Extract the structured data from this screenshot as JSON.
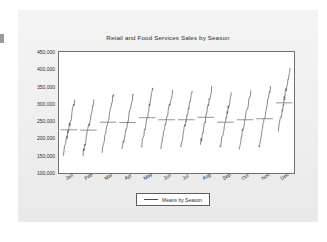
{
  "chart_data": {
    "type": "line",
    "title": "Retail and Food Services Sales by Season",
    "xlabel": "",
    "ylabel": "",
    "ylim": [
      100000,
      450000
    ],
    "ytick_labels": [
      "450,000",
      "400,000",
      "350,000",
      "300,000",
      "250,000",
      "200,000",
      "150,000",
      "100,000"
    ],
    "ytick_values": [
      450000,
      400000,
      350000,
      300000,
      250000,
      200000,
      150000,
      100000
    ],
    "grid": false,
    "legend_position": "below-center",
    "legend_entries": [
      "Means by Season"
    ],
    "categories": [
      "Jan",
      "Feb",
      "Mar",
      "Apr",
      "May",
      "Jun",
      "Jul",
      "Aug",
      "Sep",
      "Oct",
      "Nov",
      "Dec"
    ],
    "series": [
      {
        "name": "Means by Season",
        "values": [
          225000,
          224000,
          247000,
          246000,
          260000,
          254000,
          254000,
          261000,
          247000,
          254000,
          257000,
          303000
        ]
      }
    ],
    "season_ranges": [
      {
        "month": "Jan",
        "min": 148000,
        "max": 310000,
        "mean": 225000
      },
      {
        "month": "Feb",
        "min": 149000,
        "max": 312000,
        "mean": 224000
      },
      {
        "month": "Mar",
        "min": 164000,
        "max": 335000,
        "mean": 247000
      },
      {
        "month": "Apr",
        "min": 163000,
        "max": 330000,
        "mean": 246000
      },
      {
        "month": "May",
        "min": 175000,
        "max": 345000,
        "mean": 260000
      },
      {
        "month": "Jun",
        "min": 174000,
        "max": 338000,
        "mean": 254000
      },
      {
        "month": "Jul",
        "min": 173000,
        "max": 337000,
        "mean": 254000
      },
      {
        "month": "Aug",
        "min": 176000,
        "max": 347000,
        "mean": 261000
      },
      {
        "month": "Sep",
        "min": 170000,
        "max": 330000,
        "mean": 247000
      },
      {
        "month": "Oct",
        "min": 176000,
        "max": 335000,
        "mean": 254000
      },
      {
        "month": "Nov",
        "min": 175000,
        "max": 344000,
        "mean": 257000
      },
      {
        "month": "Dec",
        "min": 220000,
        "max": 405000,
        "mean": 303000
      }
    ],
    "colors": {
      "line": "#555555",
      "mean_marker": "#777777",
      "frame": "#6f6f6f",
      "plot_background": "#ffffff",
      "card_background": "#f1f1f1",
      "text": "#2b2b2b"
    }
  }
}
